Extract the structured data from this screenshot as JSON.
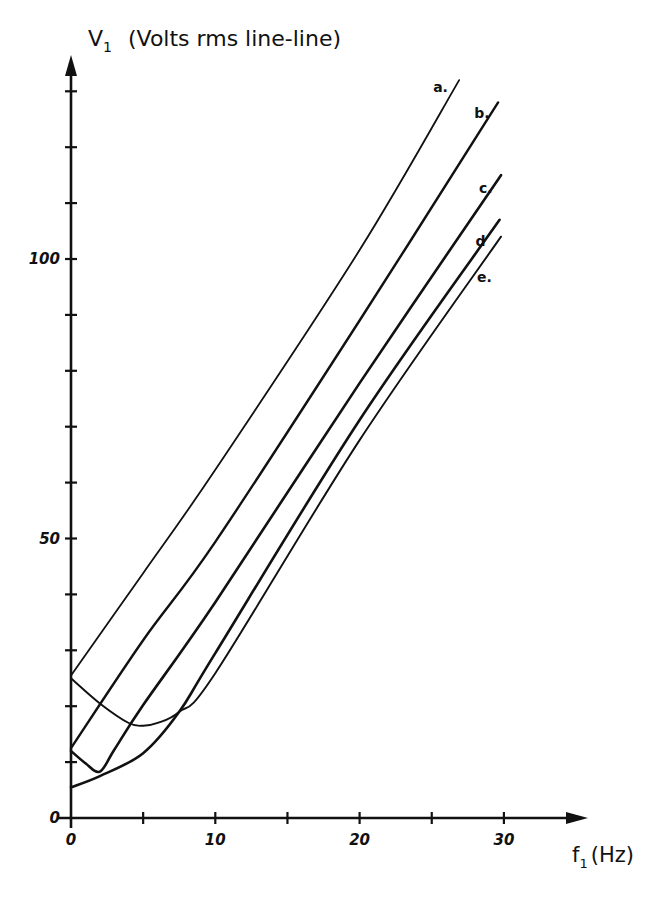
{
  "chart_data": {
    "type": "line",
    "title": "",
    "ylabel": "V₁ (Volts rms line-line)",
    "ylabel_symbol": "V",
    "ylabel_subscript": "1",
    "ylabel_units": "(Volts rms line-line)",
    "xlabel": "f₁ (Hz)",
    "xlabel_symbol": "f",
    "xlabel_subscript": "1",
    "xlabel_units": "(Hz)",
    "xlim": [
      0,
      35
    ],
    "ylim": [
      0,
      135
    ],
    "grid": false,
    "legend": "inline labels at curve ends",
    "x_tick_labels": [
      "0",
      "10",
      "20",
      "30"
    ],
    "x_ticks": [
      0,
      5,
      10,
      15,
      20,
      25,
      30
    ],
    "y_tick_labels": [
      "0",
      "50",
      "100"
    ],
    "y_ticks": [
      10,
      20,
      30,
      40,
      50,
      60,
      70,
      80,
      90,
      100,
      110,
      120,
      130
    ],
    "series": [
      {
        "name": "a.",
        "x": [
          0,
          5,
          10,
          20,
          26.9
        ],
        "values": [
          25.5,
          43.8,
          62.3,
          101.6,
          132
        ]
      },
      {
        "name": "b.",
        "x": [
          0,
          5,
          10,
          20,
          29.6
        ],
        "values": [
          12.5,
          31.8,
          49.4,
          89,
          128
        ]
      },
      {
        "name": "c.",
        "x": [
          0,
          1,
          2,
          3,
          5,
          10,
          20,
          29.8
        ],
        "values": [
          12,
          9.8,
          8.3,
          12.2,
          20.2,
          38.6,
          77.8,
          115
        ]
      },
      {
        "name": "d",
        "x": [
          0,
          2,
          5,
          7.5,
          10,
          20,
          29.7
        ],
        "values": [
          5.5,
          7.5,
          11.6,
          19,
          29.5,
          71.2,
          107
        ]
      },
      {
        "name": "e.",
        "x": [
          0,
          2,
          4,
          5,
          6,
          7.5,
          10,
          20,
          29.8
        ],
        "values": [
          25,
          20.5,
          17,
          16.5,
          17,
          19,
          25.9,
          67.6,
          104
        ]
      }
    ]
  }
}
